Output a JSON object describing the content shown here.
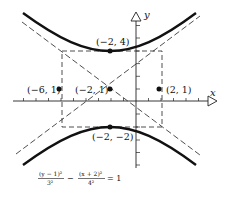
{
  "diagram": {
    "type": "hyperbola",
    "equation": {
      "term1_num": "(y − 1)²",
      "term1_den": "3²",
      "minus": "−",
      "term2_num": "(x + 2)²",
      "term2_den": "4²",
      "rhs": "= 1"
    },
    "axes": {
      "x_label": "x",
      "y_label": "y"
    },
    "center": {
      "label": "(−2, 1)",
      "x": -2,
      "y": 1
    },
    "vertices": [
      {
        "label": "(−2, 4)",
        "x": -2,
        "y": 4
      },
      {
        "label": "(−2, −2)",
        "x": -2,
        "y": -2
      }
    ],
    "side_points": [
      {
        "label": "(−6, 1)",
        "x": -6,
        "y": 1
      },
      {
        "label": "(2, 1)",
        "x": 2,
        "y": 1
      }
    ],
    "a": 3,
    "b": 4,
    "colors": {
      "ink": "#111111",
      "background": "#ffffff"
    }
  }
}
